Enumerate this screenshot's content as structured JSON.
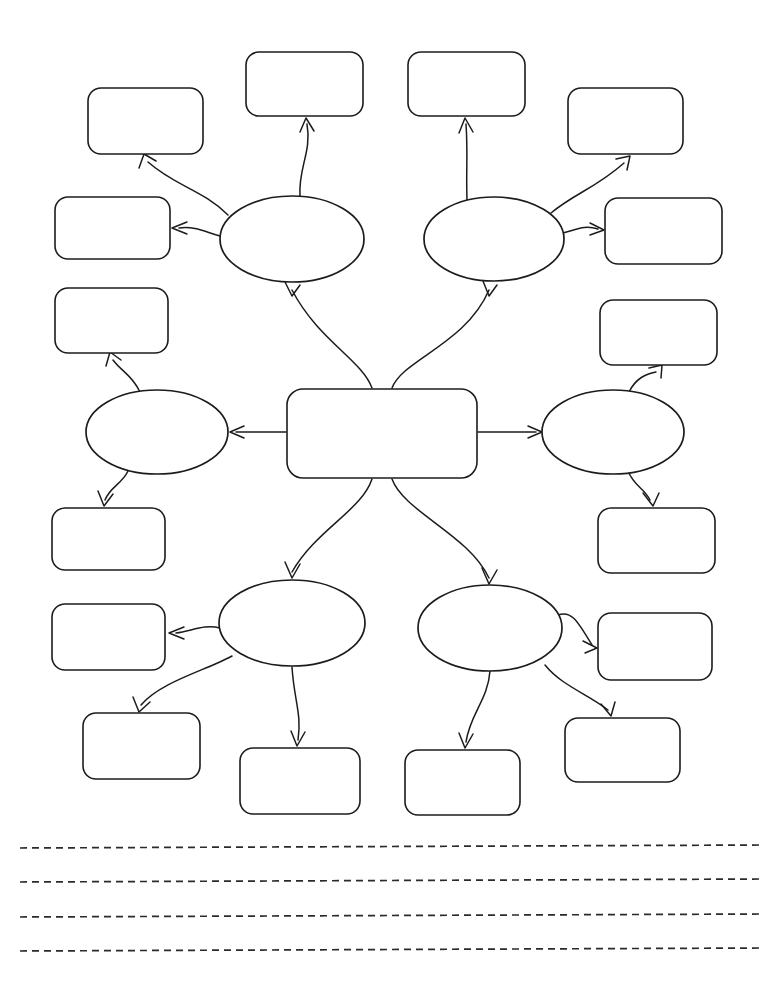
{
  "document": {
    "type": "graphic-organizer-worksheet",
    "title": "",
    "background_color": "#ffffff",
    "ink_color": "#1c1c1c",
    "page_width": 768,
    "page_height": 987
  },
  "diagram": {
    "kind": "mind-map",
    "center": {
      "id": "center",
      "shape": "rounded-rectangle",
      "label": "",
      "x": 287,
      "y": 389,
      "width": 190,
      "height": 89
    },
    "ellipses": [
      {
        "id": "ellipse-top-left",
        "shape": "ellipse",
        "label": "",
        "cx": 292,
        "cy": 239,
        "rx": 72,
        "ry": 43
      },
      {
        "id": "ellipse-top-right",
        "shape": "ellipse",
        "label": "",
        "cx": 494,
        "cy": 239,
        "rx": 70,
        "ry": 42
      },
      {
        "id": "ellipse-left",
        "shape": "ellipse",
        "label": "",
        "cx": 157,
        "cy": 432,
        "rx": 71,
        "ry": 42
      },
      {
        "id": "ellipse-right",
        "shape": "ellipse",
        "label": "",
        "cx": 613,
        "cy": 432,
        "rx": 71,
        "ry": 42
      },
      {
        "id": "ellipse-bottom-left",
        "shape": "ellipse",
        "label": "",
        "cx": 292,
        "cy": 623,
        "rx": 73,
        "ry": 43
      },
      {
        "id": "ellipse-bottom-right",
        "shape": "ellipse",
        "label": "",
        "cx": 490,
        "cy": 628,
        "rx": 72,
        "ry": 43
      }
    ],
    "boxes": [
      {
        "id": "box-01",
        "shape": "rounded-rectangle",
        "label": "",
        "x": 88,
        "y": 88,
        "width": 115,
        "height": 66,
        "parent": "ellipse-top-left"
      },
      {
        "id": "box-02",
        "shape": "rounded-rectangle",
        "label": "",
        "x": 246,
        "y": 52,
        "width": 117,
        "height": 64,
        "parent": "ellipse-top-left"
      },
      {
        "id": "box-03",
        "shape": "rounded-rectangle",
        "label": "",
        "x": 55,
        "y": 197,
        "width": 115,
        "height": 62,
        "parent": "ellipse-top-left"
      },
      {
        "id": "box-04",
        "shape": "rounded-rectangle",
        "label": "",
        "x": 408,
        "y": 52,
        "width": 117,
        "height": 64,
        "parent": "ellipse-top-right"
      },
      {
        "id": "box-05",
        "shape": "rounded-rectangle",
        "label": "",
        "x": 568,
        "y": 88,
        "width": 115,
        "height": 66,
        "parent": "ellipse-top-right"
      },
      {
        "id": "box-06",
        "shape": "rounded-rectangle",
        "label": "",
        "x": 605,
        "y": 198,
        "width": 117,
        "height": 66,
        "parent": "ellipse-top-right"
      },
      {
        "id": "box-07",
        "shape": "rounded-rectangle",
        "label": "",
        "x": 55,
        "y": 288,
        "width": 113,
        "height": 65,
        "parent": "ellipse-left"
      },
      {
        "id": "box-08",
        "shape": "rounded-rectangle",
        "label": "",
        "x": 52,
        "y": 508,
        "width": 113,
        "height": 62,
        "parent": "ellipse-left"
      },
      {
        "id": "box-09",
        "shape": "rounded-rectangle",
        "label": "",
        "x": 600,
        "y": 300,
        "width": 117,
        "height": 65,
        "parent": "ellipse-right"
      },
      {
        "id": "box-10",
        "shape": "rounded-rectangle",
        "label": "",
        "x": 598,
        "y": 508,
        "width": 117,
        "height": 65,
        "parent": "ellipse-right"
      },
      {
        "id": "box-11",
        "shape": "rounded-rectangle",
        "label": "",
        "x": 52,
        "y": 604,
        "width": 113,
        "height": 66,
        "parent": "ellipse-bottom-left"
      },
      {
        "id": "box-12",
        "shape": "rounded-rectangle",
        "label": "",
        "x": 83,
        "y": 713,
        "width": 117,
        "height": 66,
        "parent": "ellipse-bottom-left"
      },
      {
        "id": "box-13",
        "shape": "rounded-rectangle",
        "label": "",
        "x": 240,
        "y": 748,
        "width": 120,
        "height": 66,
        "parent": "ellipse-bottom-left"
      },
      {
        "id": "box-14",
        "shape": "rounded-rectangle",
        "label": "",
        "x": 405,
        "y": 750,
        "width": 115,
        "height": 65,
        "parent": "ellipse-bottom-right"
      },
      {
        "id": "box-15",
        "shape": "rounded-rectangle",
        "label": "",
        "x": 598,
        "y": 613,
        "width": 114,
        "height": 67,
        "parent": "ellipse-bottom-right"
      },
      {
        "id": "box-16",
        "shape": "rounded-rectangle",
        "label": "",
        "x": 565,
        "y": 718,
        "width": 115,
        "height": 64,
        "parent": "ellipse-bottom-right"
      }
    ],
    "connector_count": 22,
    "connector_style": "curved-arrow"
  },
  "writing_lines": {
    "count": 4,
    "style": "dashed",
    "x_start": 20,
    "x_end": 760,
    "y_positions": [
      847,
      881,
      916,
      950
    ]
  }
}
